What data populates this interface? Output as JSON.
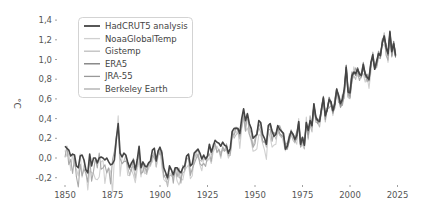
{
  "chart_data": {
    "type": "line",
    "title": "",
    "xlabel": "",
    "ylabel": "°C",
    "xlim": [
      1850,
      2025
    ],
    "ylim": [
      -0.2,
      1.4
    ],
    "grid": false,
    "legend_position": "upper-left",
    "x_ticks": [
      1850,
      1875,
      1900,
      1925,
      1950,
      1975,
      2000,
      2025
    ],
    "x_tick_labels": [
      "1850",
      "1875",
      "1900",
      "1925",
      "1950",
      "1975",
      "2000",
      "2025"
    ],
    "y_ticks": [
      -0.2,
      0.0,
      0.2,
      0.4,
      0.6,
      0.8,
      1.0,
      1.2,
      1.4
    ],
    "y_tick_labels": [
      "-0,2",
      "0,0",
      "0,2",
      "0,4",
      "0,6",
      "0,8",
      "1,0",
      "1,2",
      "1,4"
    ],
    "series": [
      {
        "name": "HadCRUT5 analysis",
        "color": "#444444",
        "width": 1.6,
        "start": 1850
      },
      {
        "name": "NoaaGlobalTemp",
        "color": "#d0d0d0",
        "width": 1.1,
        "start": 1850
      },
      {
        "name": "Gistemp",
        "color": "#bdbdbd",
        "width": 1.1,
        "start": 1880
      },
      {
        "name": "ERA5",
        "color": "#777777",
        "width": 1.1,
        "start": 1979
      },
      {
        "name": "JRA-55",
        "color": "#999999",
        "width": 1.1,
        "start": 1958
      },
      {
        "name": "Berkeley Earth",
        "color": "#aaaaaa",
        "width": 1.1,
        "start": 1850
      }
    ],
    "base_values": {
      "start_year": 1850,
      "end_year": 2022,
      "values": [
        0.12,
        0.1,
        0.08,
        0.02,
        0.04,
        0.03,
        -0.08,
        -0.1,
        0.02,
        0.03,
        -0.02,
        -0.12,
        -0.15,
        0.04,
        -0.08,
        0.0,
        0.0,
        -0.05,
        0.0,
        0.01,
        0.0,
        -0.02,
        0.0,
        -0.04,
        -0.07,
        -0.06,
        -0.02,
        0.19,
        0.35,
        0.05,
        0.01,
        0.05,
        0.03,
        -0.04,
        -0.1,
        -0.05,
        -0.02,
        -0.12,
        -0.02,
        0.12,
        -0.1,
        -0.04,
        -0.08,
        -0.09,
        -0.05,
        -0.03,
        0.08,
        0.1,
        -0.03,
        0.07,
        0.11,
        0.05,
        -0.1,
        -0.15,
        -0.2,
        -0.08,
        -0.12,
        -0.17,
        -0.1,
        -0.1,
        -0.13,
        -0.15,
        -0.1,
        -0.08,
        0.02,
        0.04,
        -0.08,
        -0.06,
        0.05,
        0.07,
        0.09,
        0.05,
        -0.01,
        0.03,
        -0.01,
        0.02,
        0.14,
        0.06,
        0.12,
        0.18,
        0.16,
        0.15,
        0.12,
        0.16,
        0.13,
        0.12,
        0.05,
        0.1,
        0.27,
        0.3,
        0.3,
        0.3,
        0.25,
        0.4,
        0.5,
        0.38,
        0.45,
        0.35,
        0.3,
        0.2,
        0.22,
        0.24,
        0.38,
        0.36,
        0.24,
        0.2,
        0.14,
        0.33,
        0.35,
        0.27,
        0.22,
        0.24,
        0.33,
        0.29,
        0.27,
        0.25,
        0.09,
        0.12,
        0.21,
        0.27,
        0.24,
        0.19,
        0.23,
        0.37,
        0.14,
        0.21,
        0.13,
        0.36,
        0.28,
        0.38,
        0.33,
        0.55,
        0.42,
        0.38,
        0.37,
        0.5,
        0.61,
        0.43,
        0.49,
        0.59,
        0.57,
        0.48,
        0.55,
        0.7,
        0.63,
        0.55,
        0.6,
        0.7,
        0.92,
        0.67,
        0.66,
        0.83,
        0.87,
        0.86,
        0.9,
        0.85,
        0.84,
        0.95,
        0.85,
        0.82,
        0.8,
        0.97,
        1.05,
        0.9,
        0.98,
        1.06,
        1.04,
        1.17,
        1.24,
        1.12,
        1.06,
        1.28,
        1.08,
        1.16,
        1.04
      ]
    },
    "series_offsets": {
      "NoaaGlobalTemp": {
        "offset": -0.08,
        "noise_seed": 3,
        "noise_amp": 0.08
      },
      "Gistemp": {
        "offset": -0.05,
        "noise_seed": 7,
        "noise_amp": 0.05
      },
      "ERA5": {
        "offset": 0.0,
        "noise_seed": 11,
        "noise_amp": 0.03
      },
      "JRA-55": {
        "offset": -0.02,
        "noise_seed": 13,
        "noise_amp": 0.04
      },
      "Berkeley Earth": {
        "offset": -0.04,
        "noise_seed": 17,
        "noise_amp": 0.07
      }
    }
  },
  "legend": {
    "items": [
      {
        "label": "HadCRUT5 analysis",
        "color": "#444444"
      },
      {
        "label": "NoaaGlobalTemp",
        "color": "#d0d0d0"
      },
      {
        "label": "Gistemp",
        "color": "#bdbdbd"
      },
      {
        "label": "ERA5",
        "color": "#777777"
      },
      {
        "label": "JRA-55",
        "color": "#999999"
      },
      {
        "label": "Berkeley Earth",
        "color": "#aaaaaa"
      }
    ]
  },
  "axis": {
    "y_unit": "°C"
  }
}
